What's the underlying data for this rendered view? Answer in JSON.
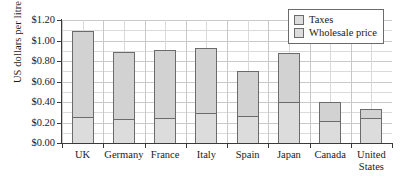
{
  "chart_data": {
    "type": "bar",
    "stacked": true,
    "title": "",
    "xlabel": "",
    "ylabel": "US dollars per litre",
    "ylim": [
      0,
      1.2
    ],
    "ytick_values": [
      0.0,
      0.2,
      0.4,
      0.6,
      0.8,
      1.0,
      1.2
    ],
    "ytick_labels": [
      "$0.00",
      "$0.20",
      "$0.40",
      "$0.60",
      "$0.80",
      "$1.00",
      "$1.20"
    ],
    "grid": true,
    "legend_position": "top-right",
    "categories": [
      "UK",
      "Germany",
      "France",
      "Italy",
      "Spain",
      "Japan",
      "Canada",
      "United\nStates"
    ],
    "series": [
      {
        "name": "Wholesale price",
        "color": "#dcdcdc",
        "values": [
          0.25,
          0.23,
          0.24,
          0.29,
          0.26,
          0.4,
          0.21,
          0.24
        ]
      },
      {
        "name": "Taxes",
        "color": "#d2d2d2",
        "values": [
          0.84,
          0.66,
          0.67,
          0.64,
          0.44,
          0.48,
          0.19,
          0.09
        ]
      }
    ],
    "totals": [
      1.09,
      0.89,
      0.91,
      0.93,
      0.7,
      0.88,
      0.4,
      0.33
    ]
  },
  "legend": {
    "items": [
      {
        "label": "Taxes"
      },
      {
        "label": "Wholesale price"
      }
    ]
  },
  "colors": {
    "bar_fill": "#d6d6d6",
    "bar_border": "#6b6b6b",
    "grid": "#c9c9c9",
    "axis": "#3a3a3a",
    "text": "#1a1a1a"
  }
}
